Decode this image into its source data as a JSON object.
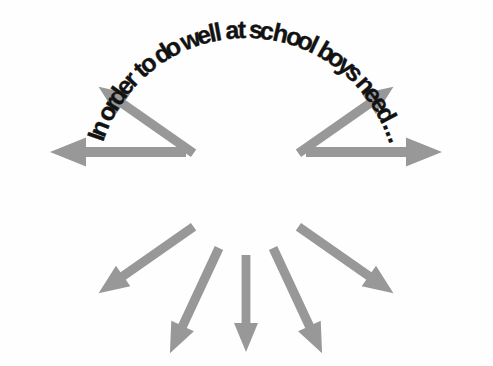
{
  "page": {
    "background_color": "#ffffff",
    "width": 493,
    "height": 366
  },
  "heading": {
    "name": "curved-heading",
    "full_text": "In order to do well at school boys need ...",
    "text_without_ellipsis": "In order to do well at school boys need",
    "ellipsis": "...",
    "style": "bold curved arc text",
    "color": "#121212",
    "font_size_px": 25,
    "arc_start_angle_deg": 198,
    "arc_end_angle_deg": 342,
    "arc_radius_px": 150,
    "arc_center_x": 246,
    "arc_center_y": 188,
    "characters": [
      "I",
      "n",
      " ",
      "o",
      "r",
      "d",
      "e",
      "r",
      " ",
      "t",
      "o",
      " ",
      "d",
      "o",
      " ",
      "w",
      "e",
      "l",
      "l",
      " ",
      "a",
      "t",
      " ",
      "s",
      "c",
      "h",
      "o",
      "o",
      "l",
      " ",
      "b",
      "o",
      "y",
      "s",
      " ",
      "n",
      "e",
      "e",
      "d",
      " ",
      "..."
    ]
  },
  "chart_data": {
    "type": "diagram",
    "subtype": "radial-burst",
    "center": {
      "x": 246,
      "y": 190
    },
    "arrow_color": "#989898",
    "arrow_count": 10,
    "arrows": [
      {
        "id": "arrow-up-left",
        "label": "up-left",
        "angle_deg": 215,
        "inner_radius": 70,
        "outer_radius": 180,
        "direction": "outward"
      },
      {
        "id": "arrow-left",
        "label": "left",
        "angle_deg": 180,
        "inner_radius": 75,
        "outer_radius": 205,
        "direction": "outward"
      },
      {
        "id": "arrow-down-left",
        "label": "down-left",
        "angle_deg": 145,
        "inner_radius": 70,
        "outer_radius": 185,
        "direction": "outward"
      },
      {
        "id": "arrow-down-left-low",
        "label": "down-left-low",
        "angle_deg": 115,
        "inner_radius": 70,
        "outer_radius": 185,
        "direction": "outward"
      },
      {
        "id": "arrow-down",
        "label": "down",
        "angle_deg": 90,
        "inner_radius": 70,
        "outer_radius": 165,
        "direction": "outward"
      },
      {
        "id": "arrow-down-right-low",
        "label": "down-right-low",
        "angle_deg": 65,
        "inner_radius": 70,
        "outer_radius": 185,
        "direction": "outward"
      },
      {
        "id": "arrow-down-right",
        "label": "down-right",
        "angle_deg": 35,
        "inner_radius": 70,
        "outer_radius": 185,
        "direction": "outward"
      },
      {
        "id": "arrow-right",
        "label": "right",
        "angle_deg": 0,
        "inner_radius": 75,
        "outer_radius": 205,
        "direction": "outward"
      },
      {
        "id": "arrow-up-right",
        "label": "up-right",
        "angle_deg": 325,
        "inner_radius": 70,
        "outer_radius": 180,
        "direction": "outward"
      },
      {
        "id": "arrow-up-left-upper",
        "label": "up-left-upper",
        "angle_deg": 145,
        "inner_radius": 0,
        "outer_radius": 0,
        "direction": "outward"
      }
    ],
    "xlabel": "",
    "ylabel": "",
    "legend": [],
    "grid": false
  }
}
